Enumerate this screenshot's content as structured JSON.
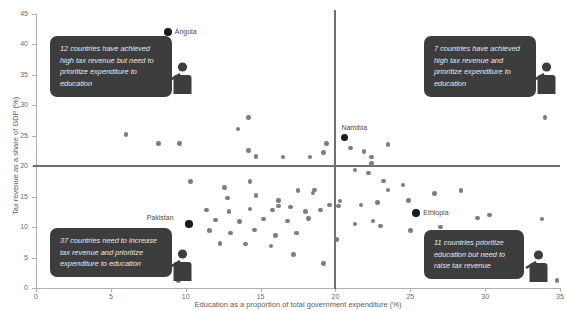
{
  "chart_data": {
    "type": "scatter",
    "title": "",
    "xlabel": "Education as a proportion of total government expenditure (%)",
    "ylabel": "Tax revenue as a share of GDP (%)",
    "xlim": [
      0,
      35
    ],
    "ylim": [
      0,
      45
    ],
    "xticks": [
      0,
      5,
      10,
      15,
      20,
      25,
      30,
      35
    ],
    "yticks": [
      0,
      5,
      10,
      15,
      20,
      25,
      30,
      35,
      40,
      45
    ],
    "grid": false,
    "legend": "none",
    "threshold_x": 20,
    "threshold_y": 20,
    "colors": {
      "point": "#7d7d7d",
      "highlight_point": "#1c1c1c",
      "threshold_line": "#6f6f6f",
      "axis": "#b0b0b0",
      "callout_background": "#3d3d3d",
      "callout_text": "#e8e8e8"
    },
    "labelled_points": [
      {
        "name": "Angola",
        "x": 8.8,
        "y": 42.0
      },
      {
        "name": "Namibia",
        "x": 20.6,
        "y": 24.7
      },
      {
        "name": "Pakistan",
        "x": 10.2,
        "y": 10.5
      },
      {
        "name": "Ethiopia",
        "x": 25.4,
        "y": 12.3
      }
    ],
    "points": [
      {
        "x": 8.8,
        "y": 42.0,
        "highlight": true,
        "label": "Angola"
      },
      {
        "x": 20.6,
        "y": 24.7,
        "highlight": true,
        "label": "Namibia"
      },
      {
        "x": 10.2,
        "y": 10.5,
        "highlight": true,
        "label": "Pakistan"
      },
      {
        "x": 25.4,
        "y": 12.3,
        "highlight": true,
        "label": "Ethiopia"
      },
      {
        "x": 6.0,
        "y": 25.2
      },
      {
        "x": 8.2,
        "y": 23.7
      },
      {
        "x": 9.6,
        "y": 23.7
      },
      {
        "x": 14.2,
        "y": 28.0
      },
      {
        "x": 13.5,
        "y": 26.1
      },
      {
        "x": 14.2,
        "y": 22.6
      },
      {
        "x": 14.7,
        "y": 21.6
      },
      {
        "x": 16.5,
        "y": 21.5
      },
      {
        "x": 18.3,
        "y": 21.5
      },
      {
        "x": 21.9,
        "y": 22.4
      },
      {
        "x": 21.0,
        "y": 23.0
      },
      {
        "x": 19.4,
        "y": 23.7
      },
      {
        "x": 19.2,
        "y": 22.3
      },
      {
        "x": 23.5,
        "y": 23.6
      },
      {
        "x": 34.0,
        "y": 28.0
      },
      {
        "x": 22.4,
        "y": 21.5
      },
      {
        "x": 22.4,
        "y": 20.4
      },
      {
        "x": 21.3,
        "y": 19.4
      },
      {
        "x": 10.3,
        "y": 17.5
      },
      {
        "x": 12.6,
        "y": 16.5
      },
      {
        "x": 14.3,
        "y": 17.5
      },
      {
        "x": 12.8,
        "y": 14.8
      },
      {
        "x": 14.7,
        "y": 15.2
      },
      {
        "x": 16.2,
        "y": 14.4
      },
      {
        "x": 17.5,
        "y": 16.0
      },
      {
        "x": 18.5,
        "y": 15.6
      },
      {
        "x": 18.6,
        "y": 16.1
      },
      {
        "x": 19.6,
        "y": 13.6
      },
      {
        "x": 20.2,
        "y": 13.5
      },
      {
        "x": 20.3,
        "y": 14.3
      },
      {
        "x": 22.8,
        "y": 14.0
      },
      {
        "x": 21.7,
        "y": 13.6
      },
      {
        "x": 23.5,
        "y": 16.1
      },
      {
        "x": 24.9,
        "y": 14.4
      },
      {
        "x": 22.2,
        "y": 18.9
      },
      {
        "x": 23.2,
        "y": 17.6
      },
      {
        "x": 24.5,
        "y": 16.9
      },
      {
        "x": 26.6,
        "y": 15.5
      },
      {
        "x": 28.4,
        "y": 16.0
      },
      {
        "x": 11.4,
        "y": 12.8
      },
      {
        "x": 12.9,
        "y": 12.6
      },
      {
        "x": 14.3,
        "y": 13.0
      },
      {
        "x": 15.8,
        "y": 12.8
      },
      {
        "x": 16.2,
        "y": 13.5
      },
      {
        "x": 17.0,
        "y": 13.3
      },
      {
        "x": 18.0,
        "y": 12.6
      },
      {
        "x": 19.0,
        "y": 12.8
      },
      {
        "x": 12.0,
        "y": 11.2
      },
      {
        "x": 13.6,
        "y": 10.9
      },
      {
        "x": 15.2,
        "y": 11.3
      },
      {
        "x": 16.8,
        "y": 11.0
      },
      {
        "x": 18.2,
        "y": 11.4
      },
      {
        "x": 11.6,
        "y": 9.4
      },
      {
        "x": 13.0,
        "y": 9.0
      },
      {
        "x": 14.6,
        "y": 9.5
      },
      {
        "x": 16.0,
        "y": 8.6
      },
      {
        "x": 17.4,
        "y": 9.0
      },
      {
        "x": 12.3,
        "y": 7.3
      },
      {
        "x": 14.0,
        "y": 7.2
      },
      {
        "x": 15.7,
        "y": 6.9
      },
      {
        "x": 17.2,
        "y": 5.5
      },
      {
        "x": 19.2,
        "y": 4.0
      },
      {
        "x": 21.3,
        "y": 10.5
      },
      {
        "x": 22.5,
        "y": 11.0
      },
      {
        "x": 23.0,
        "y": 10.2
      },
      {
        "x": 25.0,
        "y": 9.4
      },
      {
        "x": 27.0,
        "y": 10.0
      },
      {
        "x": 29.5,
        "y": 11.5
      },
      {
        "x": 30.3,
        "y": 12.0
      },
      {
        "x": 33.8,
        "y": 11.3
      },
      {
        "x": 26.5,
        "y": 7.0
      },
      {
        "x": 20.1,
        "y": 8.0
      },
      {
        "x": 9.5,
        "y": 1.2
      },
      {
        "x": 34.8,
        "y": 1.2
      }
    ]
  },
  "callouts": {
    "top_left": {
      "text": "12 countries have achieved high tax revenue but need to prioritize expenditure to education",
      "quadrant": "upper-left"
    },
    "top_right": {
      "text": "7 countries have achieved high tax revenue and prioritize expenditure to education",
      "quadrant": "upper-right"
    },
    "bottom_left": {
      "text": "37 countries need to increase tax revenue and prioritize expenditure to education",
      "quadrant": "lower-left"
    },
    "bottom_right": {
      "text": "11 countries prioritize education but need to raise tax revenue",
      "quadrant": "lower-right"
    }
  }
}
